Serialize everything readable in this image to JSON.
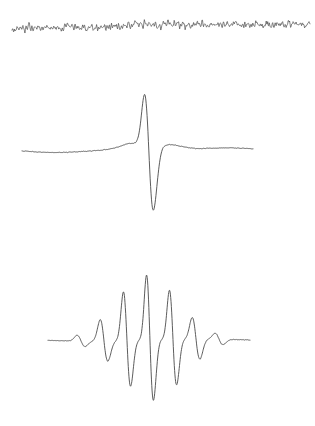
{
  "figure": {
    "title": "",
    "background_color": "#ffffff",
    "width": 315,
    "height": 426,
    "panel_count": 3
  },
  "chart_data": {
    "type": "line",
    "title": "",
    "subtitle": "",
    "xlabel": "",
    "ylabel": "",
    "grid": false,
    "legend_position": "none",
    "axes_visible": false,
    "tick_labels": [],
    "annotations": [],
    "stroke_color": "#4a4a4a",
    "panels": [
      {
        "name": "raw-noise-trace",
        "label": "Raw noisy signal",
        "type": "line",
        "description": "Dense high-frequency low-amplitude noise along a nearly flat, slightly tilted baseline spanning the full figure width.",
        "x_range": [
          12,
          310
        ],
        "y_baseline_left": 28,
        "y_baseline_right": 23,
        "amplitude_peak_to_peak": 7,
        "noise_sigma": 1.6,
        "sample_count": 600,
        "stroke_width": 0.7,
        "seed": 1337
      },
      {
        "name": "averaged-spike-trace",
        "label": "Averaged biphasic spike",
        "type": "line",
        "description": "Smooth flat baseline with a single tall sharp positive peak immediately followed by a deep negative trough, then a slow recovery back to baseline.",
        "x_range": [
          22,
          253
        ],
        "y_baseline": 150,
        "peak_x": 146,
        "peak_y": 75,
        "trough_x": 152,
        "trough_y": 228,
        "peak_amplitude": 75,
        "trough_amplitude": -78,
        "peak_width": 7,
        "trough_width": 7,
        "noise_sigma": 0.5,
        "sample_count": 520,
        "stroke_width": 0.9,
        "seed": 24601
      },
      {
        "name": "wavelet-packet-trace",
        "label": "Oscillatory wave packet",
        "type": "line",
        "description": "A modulated burst of biphasic spikes: amplitude grows from the left, reaches a maximum central spike, then decays to the right; each cycle is a sharp positive deflection followed by a negative deflection.",
        "x_range": [
          48,
          250
        ],
        "y_baseline": 340,
        "center_x": 147,
        "peak_x": 147,
        "peak_y": 268,
        "trough_x": 153,
        "trough_y": 405,
        "cycle_spacing": 23,
        "cycle_count": 9,
        "envelope_sigma": 32,
        "peak_amplitude": 72,
        "trough_amplitude": -65,
        "noise_sigma": 0.4,
        "sample_count": 620,
        "stroke_width": 0.9,
        "seed": 90210
      }
    ]
  }
}
